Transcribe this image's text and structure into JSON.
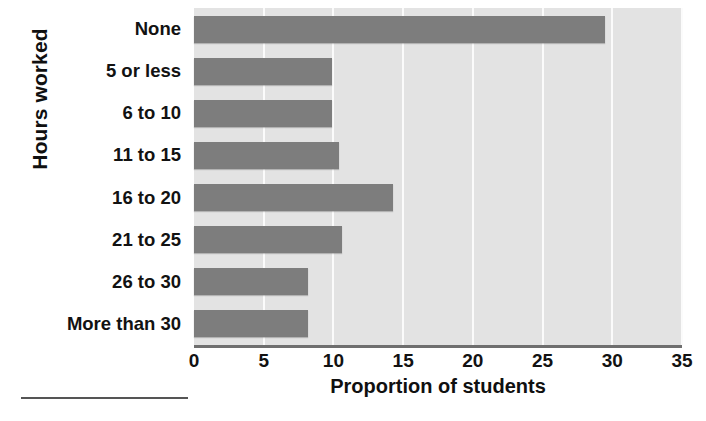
{
  "chart_data": {
    "type": "bar",
    "orientation": "horizontal",
    "title": "",
    "xlabel": "Proportion of students",
    "ylabel": "Hours worked",
    "categories": [
      "None",
      "5 or less",
      "6 to 10",
      "11 to 15",
      "16 to 20",
      "21 to 25",
      "26 to 30",
      "More than 30"
    ],
    "values": [
      29.5,
      9.9,
      9.9,
      10.4,
      14.3,
      10.6,
      8.2,
      8.2
    ],
    "xlim": [
      0,
      35
    ],
    "xticks": [
      0,
      5,
      10,
      15,
      20,
      25,
      30,
      35
    ],
    "xtick_labels": [
      "0",
      "5",
      "10",
      "15",
      "20",
      "25",
      "30",
      "35"
    ],
    "grid": "vertical",
    "legend": "none",
    "colors": {
      "bar": "#7d7d7d",
      "plot_background": "#e3e3e3",
      "gridline": "#fbfbfb",
      "axis_line": "#6f6f6f",
      "text": "#121212",
      "page_background": "#ffffff"
    }
  }
}
